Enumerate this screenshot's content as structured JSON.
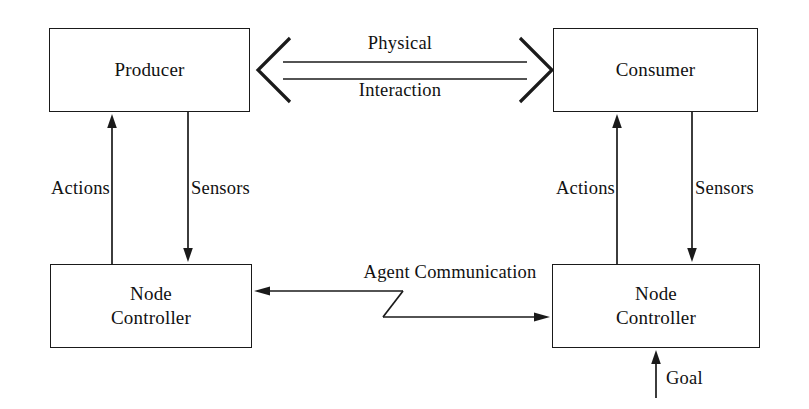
{
  "diagram": {
    "stroke_color": "#1a1a1a",
    "background_color": "#ffffff",
    "nodes": [
      {
        "id": "producer",
        "lines": [
          "Producer"
        ],
        "x": 49,
        "y": 28,
        "w": 201,
        "h": 84
      },
      {
        "id": "consumer",
        "lines": [
          "Consumer"
        ],
        "x": 553,
        "y": 28,
        "w": 205,
        "h": 84
      },
      {
        "id": "node-controller-left",
        "lines": [
          "Node",
          "Controller"
        ],
        "x": 50,
        "y": 264,
        "w": 202,
        "h": 84
      },
      {
        "id": "node-controller-right",
        "lines": [
          "Node",
          "Controller"
        ],
        "x": 552,
        "y": 264,
        "w": 208,
        "h": 84
      }
    ],
    "node_text": {
      "producer": "Producer",
      "consumer": "Consumer",
      "node_line1": "Node",
      "node_line2": "Controller"
    },
    "edges": [
      {
        "id": "physical-interaction",
        "label": "Physical Interaction",
        "from": "producer",
        "to": "consumer",
        "style": "double-headed-hollow-arrow",
        "direction": "bidirectional"
      },
      {
        "id": "actions-left",
        "label": "Actions",
        "from": "node-controller-left",
        "to": "producer",
        "direction": "up"
      },
      {
        "id": "sensors-left",
        "label": "Sensors",
        "from": "producer",
        "to": "node-controller-left",
        "direction": "down"
      },
      {
        "id": "actions-right",
        "label": "Actions",
        "from": "node-controller-right",
        "to": "consumer",
        "direction": "up"
      },
      {
        "id": "sensors-right",
        "label": "Sensors",
        "from": "consumer",
        "to": "node-controller-right",
        "direction": "down"
      },
      {
        "id": "agent-communication",
        "label": "Agent Communication",
        "from": "node-controller-right",
        "to": "node-controller-left",
        "style": "zigzag-bidirectional",
        "direction": "bidirectional"
      },
      {
        "id": "goal",
        "label": "Goal",
        "from": "external",
        "to": "node-controller-right",
        "direction": "up"
      }
    ],
    "labels": {
      "physical": "Physical",
      "interaction": "Interaction",
      "actions_left": "Actions",
      "sensors_left": "Sensors",
      "actions_right": "Actions",
      "sensors_right": "Sensors",
      "agent_communication": "Agent Communication",
      "goal": "Goal"
    }
  }
}
